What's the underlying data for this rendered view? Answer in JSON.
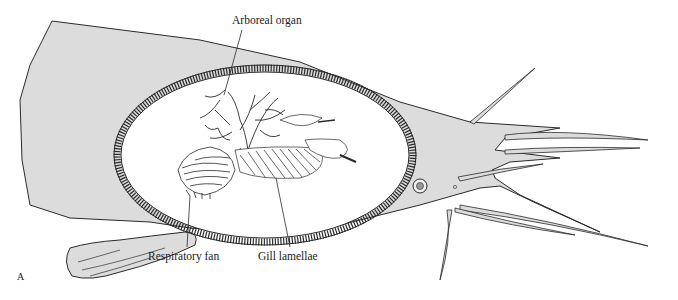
{
  "figure": {
    "panel_letter": "A",
    "labels": {
      "arboreal_organ": "Arboreal organ",
      "respiratory_fan": "Respiratory fan",
      "gill_lamellae": "Gill lamellae"
    },
    "colors": {
      "body_fill": "#dcdcdc",
      "outline": "#2a2a2a",
      "cavity_fill": "#ffffff",
      "background": "#ffffff"
    }
  }
}
